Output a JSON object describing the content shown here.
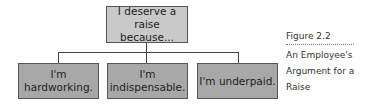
{
  "diagram": {
    "root": {
      "label": "I deserve a\nraise because..."
    },
    "children": [
      {
        "label": "I'm\nhardworking."
      },
      {
        "label": "I'm\nindispensable."
      },
      {
        "label": "I'm underpaid."
      }
    ],
    "colors": {
      "root_fill": "#c9c9c9",
      "child_fill": "#a8a8a8",
      "border": "#555555",
      "connector": "#444444"
    }
  },
  "caption": {
    "figure_label": "Figure 2.2",
    "title": "An Employee's Argument for a Raise"
  }
}
